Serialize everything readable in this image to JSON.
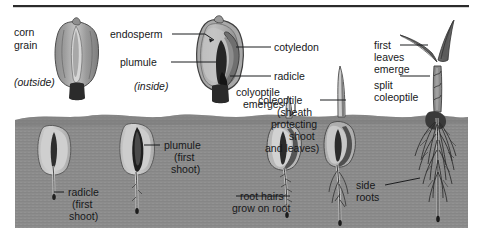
{
  "figure": {
    "top_rule_color": "#2b2b2b",
    "soil_color": "#8f8f8f",
    "soil_shadow_color": "#767676",
    "background_color": "#ffffff",
    "ink_color": "#17181a",
    "seed_light_color": "#c9c9c9",
    "seed_mid_color": "#9a9a9a",
    "seed_dark_color": "#3a3a3a",
    "plant_color": "#6e6e6e",
    "root_color": "#2f2f2f"
  },
  "labels": {
    "corn_grain": "corn\ngrain",
    "corn_grain_line1": "corn",
    "corn_grain_line2": "grain",
    "outside": "(outside)",
    "inside": "(inside)",
    "endosperm": "endosperm",
    "plumule": "plumule",
    "cotyledon": "cotyledon",
    "radicle": "radicle",
    "colyoptile_emerges_line1": "colyoptile",
    "colyoptile_emerges_line2": "emerges",
    "radicle_first_shoot_line1": "radicle",
    "radicle_first_shoot_line2": "(first",
    "radicle_first_shoot_line3": "shoot)",
    "plumule_first_shoot_line1": "plumule",
    "plumule_first_shoot_line2": "(first",
    "plumule_first_shoot_line3": "shoot)",
    "root_hairs_line1": "root hairs",
    "root_hairs_line2": "grow on root",
    "coleoptile_sheath_line1": "coleoptile",
    "coleoptile_sheath_line2": "(sheath",
    "coleoptile_sheath_line3": "protecting",
    "coleoptile_sheath_line4": "shoot",
    "coleoptile_sheath_line5": "and leaves)",
    "first_leaves_line1": "first",
    "first_leaves_line2": "leaves",
    "first_leaves_line3": "emerge",
    "split_coleoptile_line1": "split",
    "split_coleoptile_line2": "coleoptile",
    "side_roots_line1": "side",
    "side_roots_line2": "roots"
  },
  "stages": [
    {
      "name": "whole-grain-outside",
      "caption": "(outside)",
      "label": "corn grain"
    },
    {
      "name": "grain-cross-section",
      "caption": "(inside)",
      "parts": [
        "endosperm",
        "plumule",
        "cotyledon",
        "radicle"
      ]
    },
    {
      "name": "seed-radicle-emerging",
      "label": "radicle (first shoot)"
    },
    {
      "name": "seed-plumule-emerging",
      "label": "plumule (first shoot)"
    },
    {
      "name": "seedling-root-hairs",
      "label": "root hairs grow on root"
    },
    {
      "name": "seedling-coleoptile",
      "label": "coleoptile (sheath protecting shoot and leaves)"
    },
    {
      "name": "seedling-first-leaves",
      "labels": [
        "first leaves emerge",
        "split coleoptile",
        "side roots"
      ]
    }
  ]
}
